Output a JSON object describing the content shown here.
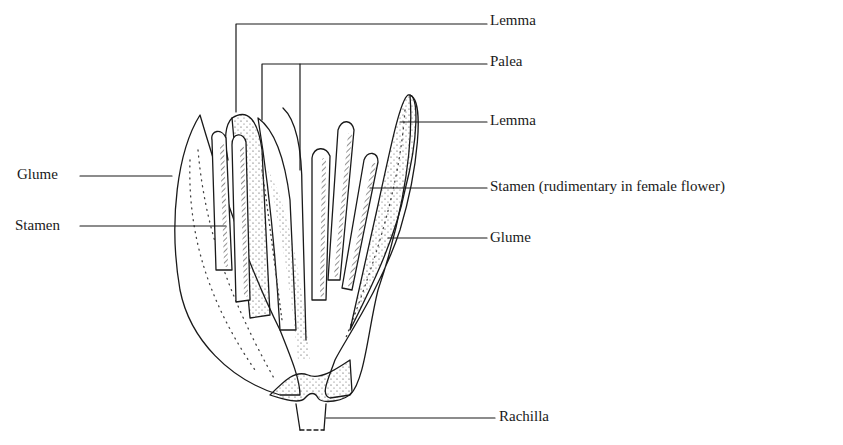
{
  "figure": {
    "labels": {
      "lemma_top": "Lemma",
      "palea": "Palea",
      "lemma_right": "Lemma",
      "glume_left": "Glume",
      "stamen_left": "Stamen",
      "stamen_right": "Stamen (rudimentary in female flower)",
      "glume_right": "Glume",
      "rachilla": "Rachilla"
    }
  },
  "colors": {
    "ink": "#1a1a1a",
    "background": "#ffffff"
  }
}
